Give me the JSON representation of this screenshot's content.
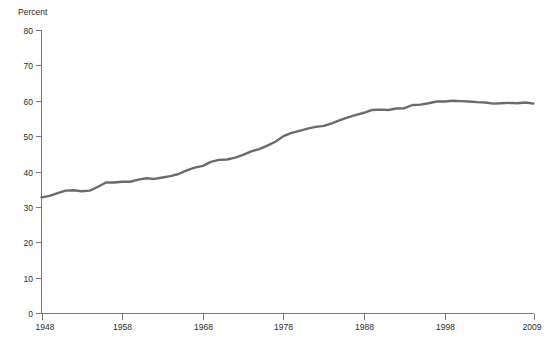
{
  "chart_data": {
    "type": "line",
    "title": "",
    "subtitle": "",
    "xlabel": "",
    "ylabel": "Percent",
    "ylim": [
      0,
      80
    ],
    "xlim": [
      1948,
      2009
    ],
    "grid": false,
    "legend": false,
    "legend_position": "none",
    "y_ticks": [
      0,
      10,
      20,
      30,
      40,
      50,
      60,
      70,
      80
    ],
    "y_tick_labels": [
      "0",
      "10",
      "20",
      "30",
      "40",
      "50",
      "60",
      "70",
      "80"
    ],
    "x_ticks": [
      1948,
      1958,
      1968,
      1978,
      1988,
      1998,
      2009
    ],
    "x_tick_labels": [
      "1948",
      "1958",
      "1968",
      "1978",
      "1988",
      "1998",
      "2009"
    ],
    "series": [
      {
        "name": "Percent",
        "color": "#6b6b6b",
        "line_width": 2.4,
        "x": [
          1948,
          1949,
          1950,
          1951,
          1952,
          1953,
          1954,
          1955,
          1956,
          1957,
          1958,
          1959,
          1960,
          1961,
          1962,
          1963,
          1964,
          1965,
          1966,
          1967,
          1968,
          1969,
          1970,
          1971,
          1972,
          1973,
          1974,
          1975,
          1976,
          1977,
          1978,
          1979,
          1980,
          1981,
          1982,
          1983,
          1984,
          1985,
          1986,
          1987,
          1988,
          1989,
          1990,
          1991,
          1992,
          1993,
          1994,
          1995,
          1996,
          1997,
          1998,
          1999,
          2000,
          2001,
          2002,
          2003,
          2004,
          2005,
          2006,
          2007,
          2008,
          2009
        ],
        "values": [
          32.7,
          33.1,
          33.9,
          34.6,
          34.7,
          34.4,
          34.6,
          35.7,
          36.9,
          36.9,
          37.1,
          37.1,
          37.7,
          38.1,
          37.9,
          38.3,
          38.7,
          39.3,
          40.3,
          41.1,
          41.6,
          42.7,
          43.3,
          43.4,
          43.9,
          44.7,
          45.7,
          46.3,
          47.3,
          48.4,
          50.0,
          50.9,
          51.5,
          52.1,
          52.6,
          52.9,
          53.6,
          54.5,
          55.3,
          56.0,
          56.6,
          57.4,
          57.5,
          57.4,
          57.8,
          57.9,
          58.8,
          58.9,
          59.3,
          59.8,
          59.8,
          60.0,
          59.9,
          59.8,
          59.6,
          59.5,
          59.2,
          59.3,
          59.4,
          59.3,
          59.5,
          59.2
        ]
      }
    ]
  },
  "axes": {
    "y_axis_title": "Percent"
  }
}
